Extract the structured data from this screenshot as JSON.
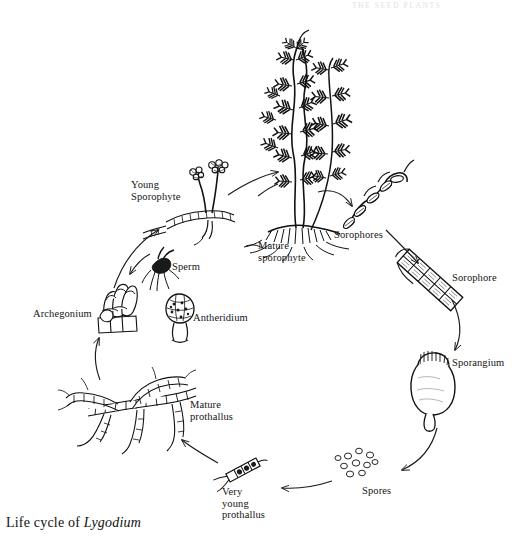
{
  "figure": {
    "header_faint": "THE SEED PLANTS",
    "caption_prefix": "Life cycle of ",
    "caption_genus": "Lygodium",
    "ink_color": "#1a1a1a",
    "background_color": "#ffffff"
  },
  "labels": [
    {
      "id": "young-sporophyte",
      "text": "Young\nSporophyte",
      "x": 131,
      "y": 179,
      "align": "left"
    },
    {
      "id": "mature-sporophyte",
      "text": "Mature\nsporophyte",
      "x": 258,
      "y": 240,
      "align": "left"
    },
    {
      "id": "sorophores",
      "text": "Sorophores",
      "x": 334,
      "y": 229,
      "align": "left"
    },
    {
      "id": "sorophore",
      "text": "Sorophore",
      "x": 452,
      "y": 272,
      "align": "left"
    },
    {
      "id": "sporangium",
      "text": "Sporangium",
      "x": 452,
      "y": 357,
      "align": "left"
    },
    {
      "id": "spores",
      "text": "Spores",
      "x": 362,
      "y": 485,
      "align": "left"
    },
    {
      "id": "very-young-prothallus",
      "text": "Very\nyoung\nprothallus",
      "x": 222,
      "y": 486,
      "align": "left"
    },
    {
      "id": "mature-prothallus",
      "text": "Mature\nprothallus",
      "x": 190,
      "y": 399,
      "align": "left"
    },
    {
      "id": "archegonium",
      "text": "Archegonium",
      "x": 33,
      "y": 308,
      "align": "left"
    },
    {
      "id": "antheridium",
      "text": "Antheridium",
      "x": 193,
      "y": 312,
      "align": "left"
    },
    {
      "id": "sperm",
      "text": "Sperm",
      "x": 172,
      "y": 261,
      "align": "left"
    }
  ],
  "stages": [
    {
      "id": "mature-sporophyte",
      "name": "Mature sporophyte",
      "kind": "climbing-fern-plant",
      "cx": 300,
      "cy": 140
    },
    {
      "id": "sorophores",
      "name": "Sorophores",
      "kind": "fertile-branchlets",
      "cx": 375,
      "cy": 200
    },
    {
      "id": "sorophore",
      "name": "Sorophore",
      "kind": "segmented-strip",
      "cx": 432,
      "cy": 278
    },
    {
      "id": "sporangium",
      "name": "Sporangium",
      "kind": "ovoid-capsule",
      "cx": 432,
      "cy": 385
    },
    {
      "id": "spores",
      "name": "Spores",
      "kind": "spore-cluster",
      "cx": 358,
      "cy": 462
    },
    {
      "id": "very-young-prothallus",
      "name": "Very young prothallus",
      "kind": "short-filament",
      "cx": 243,
      "cy": 470
    },
    {
      "id": "mature-prothallus",
      "name": "Mature prothallus",
      "kind": "branched-filaments",
      "cx": 140,
      "cy": 408
    },
    {
      "id": "archegonium",
      "name": "Archegonium",
      "kind": "neck-cells",
      "cx": 118,
      "cy": 305
    },
    {
      "id": "antheridium",
      "name": "Antheridium",
      "kind": "globular-cell-mass",
      "cx": 180,
      "cy": 305
    },
    {
      "id": "sperm",
      "name": "Sperm",
      "kind": "flagellate-cell",
      "cx": 163,
      "cy": 272
    },
    {
      "id": "young-sporophyte",
      "name": "Young sporophyte",
      "kind": "juvenile-fern",
      "cx": 205,
      "cy": 205
    }
  ],
  "arrows": [
    {
      "id": "arrow-young-to-mature",
      "from": "young-sporophyte",
      "to": "mature-sporophyte"
    },
    {
      "id": "arrow-mature-to-sorophores",
      "from": "mature-sporophyte",
      "to": "sorophores"
    },
    {
      "id": "arrow-sorophores-to-sorophore",
      "from": "sorophores",
      "to": "sorophore"
    },
    {
      "id": "arrow-sorophore-to-sporangium",
      "from": "sorophore",
      "to": "sporangium"
    },
    {
      "id": "arrow-sporangium-to-spores",
      "from": "sporangium",
      "to": "spores"
    },
    {
      "id": "arrow-spores-to-veryyoung",
      "from": "spores",
      "to": "very-young-prothallus"
    },
    {
      "id": "arrow-veryyoung-to-mature-pro",
      "from": "very-young-prothallus",
      "to": "mature-prothallus"
    },
    {
      "id": "arrow-prothallus-to-archegonium",
      "from": "mature-prothallus",
      "to": "archegonium"
    },
    {
      "id": "arrow-archegonium-to-young",
      "from": "archegonium",
      "to": "young-sporophyte"
    },
    {
      "id": "arrow-sperm-to-archegonium",
      "from": "sperm",
      "to": "archegonium"
    }
  ]
}
